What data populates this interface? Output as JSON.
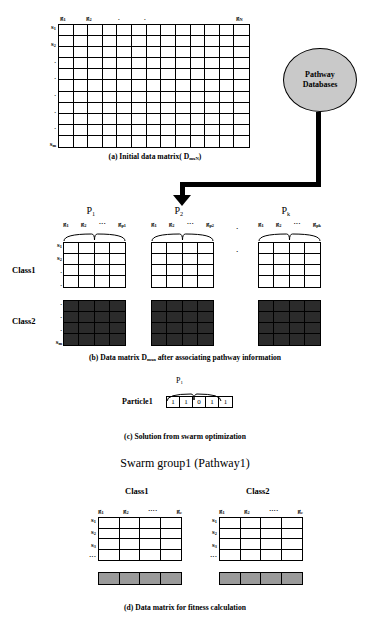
{
  "figure": {
    "top_clipped_text": "",
    "panels": {
      "a": {
        "caption": "(a) Initial data matrix( DmxN)",
        "caption_main": "(a) Initial data matrix( D",
        "caption_sub": "mxN",
        "caption_end": ")",
        "col_headers": [
          "g1",
          "g2",
          ".",
          ".",
          "gN"
        ],
        "col_header_parts": [
          {
            "base": "g",
            "sub": "1"
          },
          {
            "base": "g",
            "sub": "2"
          },
          {
            "base": ".",
            "sub": ""
          },
          {
            "base": ".",
            "sub": ""
          },
          {
            "base": "g",
            "sub": "N"
          }
        ],
        "row_labels": [
          "s1",
          "s2",
          ".",
          ".",
          ".",
          ".",
          ".",
          "sm"
        ],
        "row_label_parts": [
          {
            "base": "s",
            "sub": "1"
          },
          {
            "base": "s",
            "sub": "2"
          },
          {
            "base": ".",
            "sub": ""
          },
          {
            "base": ".",
            "sub": ""
          },
          {
            "base": ".",
            "sub": ""
          },
          {
            "base": ".",
            "sub": ""
          },
          {
            "base": ".",
            "sub": ""
          },
          {
            "base": "s",
            "sub": "m"
          }
        ],
        "rows": 11,
        "cols": 13
      },
      "database": {
        "line1": "Pathway",
        "line2": "Databases",
        "fill": "#c9c9c9"
      },
      "b": {
        "caption_prefix": "(b)",
        "caption_main": "Data matrix D",
        "caption_sub": "mxn",
        "caption_end": " after associating pathway information",
        "pathway_groups": [
          {
            "name": "P",
            "name_sub": "1",
            "gene_labels": [
              {
                "base": "g",
                "sub": "1"
              },
              {
                "base": "g",
                "sub": "2"
              },
              {
                "base": "···",
                "sub": ""
              },
              {
                "base": "g",
                "sub": "p1"
              }
            ],
            "cols": 4
          },
          {
            "name": "P",
            "name_sub": "2",
            "gene_labels": [
              {
                "base": "g",
                "sub": "1"
              },
              {
                "base": "g",
                "sub": "2"
              },
              {
                "base": "···",
                "sub": ""
              },
              {
                "base": "g",
                "sub": "p2"
              }
            ],
            "cols": 4
          },
          {
            "name": "P",
            "name_sub": "k",
            "gene_labels": [
              {
                "base": "g",
                "sub": "1"
              },
              {
                "base": "g",
                "sub": "2"
              },
              {
                "base": "···",
                "sub": ""
              },
              {
                "base": "g",
                "sub": "pk"
              }
            ],
            "cols": 4
          }
        ],
        "group_separator": "·",
        "class1_label": "Class1",
        "class2_label": "Class2",
        "class1_row_labels": [
          {
            "base": "s",
            "sub": "1"
          },
          {
            "base": "s",
            "sub": "2"
          },
          {
            "base": ".",
            "sub": ""
          },
          {
            "base": ".",
            "sub": ""
          }
        ],
        "class2_row_labels": [
          {
            "base": ".",
            "sub": ""
          },
          {
            "base": ".",
            "sub": ""
          },
          {
            "base": ".",
            "sub": ""
          },
          {
            "base": "s",
            "sub": "m"
          }
        ],
        "class1_rows": 4,
        "class2_rows": 4,
        "class1_fill": "#ffffff",
        "class2_fill": "#2b2b2b"
      },
      "c": {
        "caption": "(c)  Solution from swarm optimization",
        "particle_label": "Particle1",
        "group_label_base": "P",
        "group_label_sub": "1",
        "bits": [
          "1",
          "0",
          "1",
          "1"
        ],
        "lead_bit": "1"
      },
      "d": {
        "title": "Swarm group1 (Pathway1)",
        "caption": "(d)  Data matrix for fitness calculation",
        "class1_label": "Class1",
        "class2_label": "Class2",
        "col_headers": [
          {
            "base": "g",
            "sub": "1"
          },
          {
            "base": "g",
            "sub": "2"
          },
          {
            "base": "····",
            "sub": ""
          },
          {
            "base": "g",
            "sub": "c"
          }
        ],
        "row_labels_left": [
          {
            "base": "s",
            "sub": "1"
          },
          {
            "base": "s",
            "sub": "2"
          },
          {
            "base": "s",
            "sub": "3"
          },
          {
            "base": "···",
            "sub": ""
          }
        ],
        "row_labels_right": [
          {
            "base": "s",
            "sub": "1"
          },
          {
            "base": "s",
            "sub": "2"
          },
          {
            "base": "s",
            "sub": "3"
          },
          {
            "base": "···",
            "sub": ""
          }
        ],
        "rows": 4,
        "cols": 4,
        "summary_fill": "#9a9a9a"
      }
    }
  }
}
